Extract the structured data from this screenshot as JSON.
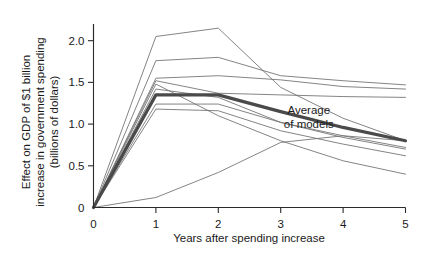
{
  "chart_data": {
    "type": "line",
    "title": "",
    "xlabel": "Years after spending increase",
    "ylabel": "Effect on GDP of $1 billion increase in government spending (billions of dollars)",
    "ylabel_lines": [
      "Effect on GDP of $1 billion",
      "increase in government spending",
      "(billions of dollars)"
    ],
    "x": [
      0,
      1,
      2,
      3,
      4,
      5
    ],
    "xlim": [
      0,
      5
    ],
    "ylim": [
      0,
      2.2
    ],
    "xticks": [
      "0",
      "1",
      "2",
      "3",
      "4",
      "5"
    ],
    "yticks": [
      "0",
      "0.5",
      "1.0",
      "1.5",
      "2.0"
    ],
    "ytick_values": [
      0,
      0.5,
      1.0,
      1.5,
      2.0
    ],
    "grid": false,
    "legend_position": "none",
    "annotations": [
      {
        "name": "average-of-models",
        "text": "Average of models",
        "text_lines": [
          "Average",
          "of models"
        ],
        "x": 3.45,
        "y": 1.12
      }
    ],
    "series": [
      {
        "name": "model-1",
        "emphasis": false,
        "color": "#6e6e6e",
        "values": [
          0,
          2.05,
          2.15,
          1.44,
          1.07,
          0.8
        ]
      },
      {
        "name": "model-2",
        "emphasis": false,
        "color": "#6e6e6e",
        "values": [
          0,
          1.76,
          1.8,
          1.58,
          1.52,
          1.47
        ]
      },
      {
        "name": "model-3",
        "emphasis": false,
        "color": "#6e6e6e",
        "values": [
          0,
          1.55,
          1.58,
          1.53,
          1.45,
          1.42
        ]
      },
      {
        "name": "model-4",
        "emphasis": false,
        "color": "#6e6e6e",
        "values": [
          0,
          1.52,
          1.37,
          1.35,
          1.33,
          1.32
        ]
      },
      {
        "name": "model-5",
        "emphasis": false,
        "color": "#6e6e6e",
        "values": [
          0,
          1.48,
          1.1,
          0.8,
          0.56,
          0.4
        ]
      },
      {
        "name": "model-6",
        "emphasis": false,
        "color": "#6e6e6e",
        "values": [
          0,
          1.42,
          1.32,
          1.02,
          0.86,
          0.72
        ]
      },
      {
        "name": "model-7",
        "emphasis": false,
        "color": "#6e6e6e",
        "values": [
          0,
          1.24,
          1.24,
          1.02,
          0.84,
          0.7
        ]
      },
      {
        "name": "model-8",
        "emphasis": false,
        "color": "#6e6e6e",
        "values": [
          0,
          1.18,
          1.16,
          0.92,
          0.76,
          0.62
        ]
      },
      {
        "name": "model-9",
        "emphasis": false,
        "color": "#6e6e6e",
        "values": [
          0,
          0.12,
          0.42,
          0.78,
          0.86,
          0.8
        ]
      },
      {
        "name": "average-of-models",
        "emphasis": true,
        "color": "#4a4a4a",
        "values": [
          0,
          1.35,
          1.35,
          1.15,
          0.96,
          0.8
        ]
      }
    ]
  }
}
